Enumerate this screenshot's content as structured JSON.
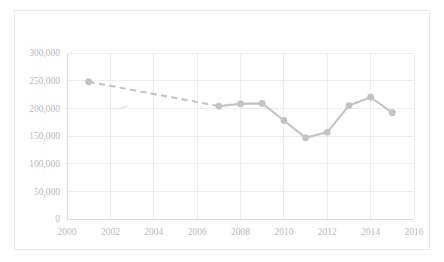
{
  "figure": {
    "background_color": "#ffffff",
    "border_color": "#e9e9ec",
    "series_color": "#c3c3c6",
    "gridline_color": "#ececed",
    "tick_label_color": "#b9b9bd"
  },
  "chart_data": {
    "type": "line",
    "title": "",
    "subtitle": "",
    "xlabel": "",
    "ylabel": "",
    "xlim": [
      2000,
      2016
    ],
    "ylim": [
      0,
      300000
    ],
    "grid": true,
    "legend": "none",
    "x_tick_labels": [
      "2000",
      "2002",
      "2004",
      "2006",
      "2008",
      "2010",
      "2012",
      "2014",
      "2016"
    ],
    "x_ticks": [
      2000,
      2002,
      2004,
      2006,
      2008,
      2010,
      2012,
      2014,
      2016
    ],
    "y_tick_labels": [
      "0",
      "50,000",
      "100,000",
      "150,000",
      "200,000",
      "250,000",
      "300,000"
    ],
    "y_ticks": [
      0,
      50000,
      100000,
      150000,
      200000,
      250000,
      300000
    ],
    "series": [
      {
        "name": "Series 1",
        "color": "#c3c3c6",
        "marker": "circle",
        "x": [
          2001,
          2007,
          2008,
          2009,
          2010,
          2011,
          2012,
          2013,
          2014,
          2015
        ],
        "values": [
          248000,
          204000,
          208000,
          209000,
          178000,
          147000,
          157000,
          205000,
          220000,
          192000
        ],
        "segments": [
          {
            "from_index": 0,
            "to_index": 1,
            "style": "dashed",
            "note": "interpolated gap 2001-2007"
          },
          {
            "from_index": 1,
            "to_index": 9,
            "style": "solid"
          }
        ]
      }
    ],
    "annotations": [
      {
        "name": "faint-stray-mark",
        "x": 2002.6,
        "y": 201000
      }
    ]
  }
}
